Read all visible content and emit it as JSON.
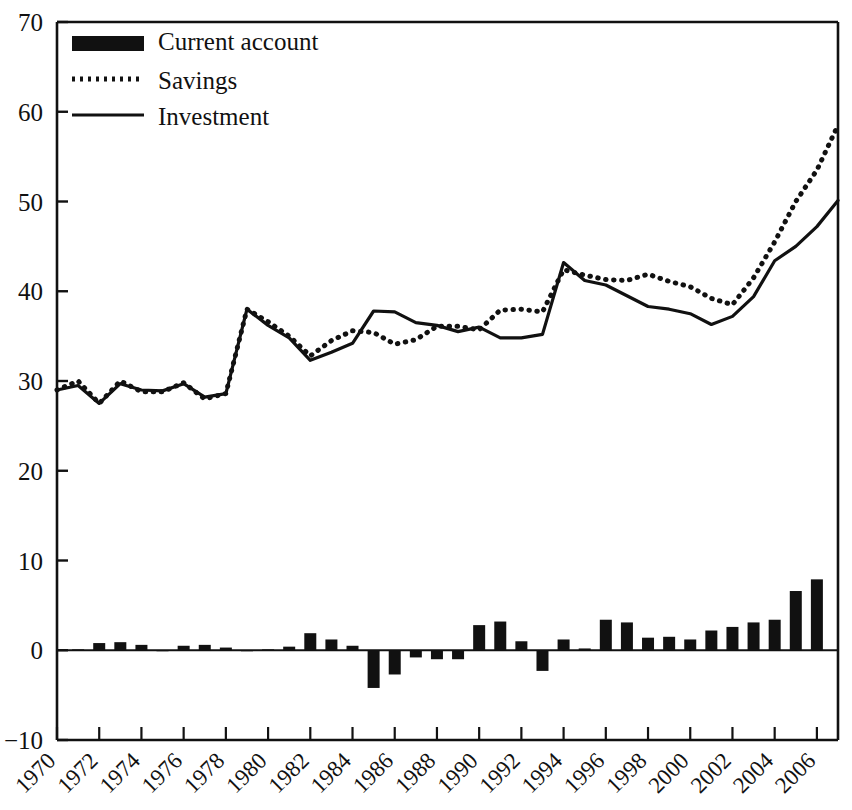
{
  "chart_data": {
    "type": "line",
    "title": "",
    "subtitle": "",
    "xlabel": "",
    "ylabel": "",
    "xlim": [
      1970,
      2007
    ],
    "ylim": [
      -10,
      70
    ],
    "yticks": [
      -10,
      0,
      10,
      20,
      30,
      40,
      50,
      60,
      70
    ],
    "ytick_labels": [
      "−10",
      "0",
      "10",
      "20",
      "30",
      "40",
      "50",
      "60",
      "70"
    ],
    "xticks": [
      1970,
      1972,
      1974,
      1976,
      1978,
      1980,
      1982,
      1984,
      1986,
      1988,
      1990,
      1992,
      1994,
      1996,
      1998,
      2000,
      2002,
      2004,
      2006
    ],
    "xtick_labels": [
      "1970",
      "1972",
      "1974",
      "1976",
      "1978",
      "1980",
      "1982",
      "1984",
      "1986",
      "1988",
      "1990",
      "1992",
      "1994",
      "1996",
      "1998",
      "2000",
      "2002",
      "2004",
      "2006"
    ],
    "xtick_rotation": -45,
    "grid": false,
    "legend_position": "top-left",
    "x": [
      1970,
      1971,
      1972,
      1973,
      1974,
      1975,
      1976,
      1977,
      1978,
      1979,
      1980,
      1981,
      1982,
      1983,
      1984,
      1985,
      1986,
      1987,
      1988,
      1989,
      1990,
      1991,
      1992,
      1993,
      1994,
      1995,
      1996,
      1997,
      1998,
      1999,
      2000,
      2001,
      2002,
      2003,
      2004,
      2005,
      2006,
      2007
    ],
    "series": [
      {
        "name": "Current account",
        "type": "bar",
        "color": "#111111",
        "values": [
          0.0,
          0.1,
          0.8,
          0.9,
          0.6,
          -0.1,
          0.5,
          0.6,
          0.3,
          -0.1,
          0.1,
          0.4,
          1.9,
          1.2,
          0.5,
          -4.2,
          -2.7,
          -0.8,
          -1.0,
          -1.0,
          2.8,
          3.2,
          1.0,
          -2.3,
          1.2,
          0.2,
          3.4,
          3.1,
          1.4,
          1.5,
          1.2,
          2.2,
          2.6,
          3.1,
          3.4,
          6.6,
          7.9,
          0.0
        ]
      },
      {
        "name": "Savings",
        "type": "line",
        "style": "dotted",
        "color": "#111111",
        "values": [
          29.0,
          30.0,
          27.5,
          30.0,
          28.8,
          28.8,
          29.8,
          28.0,
          28.6,
          38.0,
          36.6,
          35.0,
          32.8,
          34.5,
          35.6,
          35.4,
          34.1,
          34.6,
          36.1,
          36.1,
          35.7,
          37.9,
          38.0,
          37.7,
          42.4,
          41.8,
          41.3,
          41.2,
          41.9,
          41.1,
          40.5,
          39.2,
          38.5,
          41.5,
          45.5,
          50.0,
          53.5,
          58.5
        ]
      },
      {
        "name": "Investment",
        "type": "line",
        "style": "solid",
        "color": "#111111",
        "values": [
          29.0,
          29.5,
          27.5,
          29.7,
          29.0,
          28.9,
          29.7,
          28.2,
          28.6,
          38.0,
          36.2,
          34.8,
          32.3,
          33.2,
          34.2,
          37.8,
          37.7,
          36.5,
          36.2,
          35.5,
          36.0,
          34.8,
          34.8,
          35.2,
          43.2,
          41.2,
          40.7,
          39.5,
          38.3,
          38.0,
          37.5,
          36.3,
          37.2,
          39.4,
          43.4,
          45.0,
          47.2,
          50.1
        ]
      }
    ]
  },
  "legend": {
    "items": [
      {
        "label": "Current account",
        "marker": "bar-swatch"
      },
      {
        "label": "Savings",
        "marker": "dotted-line"
      },
      {
        "label": "Investment",
        "marker": "solid-line"
      }
    ]
  },
  "colors": {
    "ink": "#111111",
    "background": "#ffffff"
  }
}
